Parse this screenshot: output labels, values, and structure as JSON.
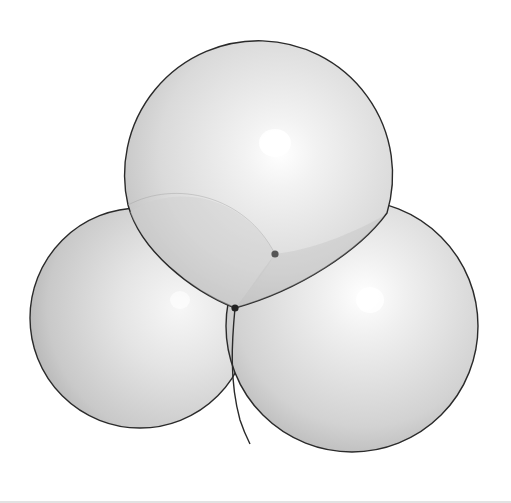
{
  "figure": {
    "type": "three-sphere-cluster",
    "colors": {
      "background": "#ffffff",
      "outline": "#2a2a2a",
      "sphere_highlight": "#ffffff",
      "sphere_mid": "#dcdcdc",
      "sphere_shadow": "#a8a8a8",
      "dot": "#222222",
      "dot_secondary": "#555555",
      "bottom_rule": "#e2e2e2"
    },
    "spheres": [
      {
        "name": "top",
        "cx": 255,
        "cy": 178,
        "r": 135,
        "highlight": [
          275,
          143
        ]
      },
      {
        "name": "left",
        "cx": 140,
        "cy": 318,
        "r": 110,
        "highlight": [
          180,
          300
        ]
      },
      {
        "name": "right",
        "cx": 352,
        "cy": 326,
        "r": 126,
        "highlight": [
          370,
          300
        ]
      }
    ],
    "points": [
      {
        "name": "triple-junction",
        "x": 235,
        "y": 308,
        "r": 4
      },
      {
        "name": "inner-vertex",
        "x": 275,
        "y": 254,
        "r": 4
      }
    ]
  }
}
